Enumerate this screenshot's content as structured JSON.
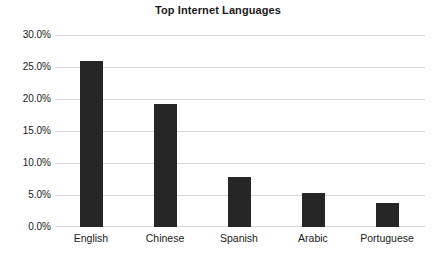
{
  "chart_data": {
    "type": "bar",
    "title": "Top Internet Languages",
    "xlabel": "",
    "ylabel": "",
    "categories": [
      "English",
      "Chinese",
      "Spanish",
      "Arabic",
      "Portuguese"
    ],
    "values": [
      26.0,
      19.4,
      7.9,
      5.3,
      3.7
    ],
    "ylim": [
      0,
      30
    ],
    "ytick_values": [
      0,
      5,
      10,
      15,
      20,
      25,
      30
    ],
    "ytick_labels": [
      "0.0%",
      "5.0%",
      "10.0%",
      "15.0%",
      "20.0%",
      "25.0%",
      "30.0%"
    ],
    "grid": true,
    "legend": false,
    "bar_color": "#262626",
    "gridline_color": "#d6d6d6",
    "background_color": "#ffffff",
    "text_color": "#1a1a1a"
  }
}
